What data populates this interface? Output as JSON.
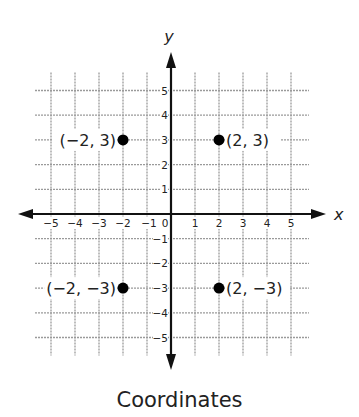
{
  "chart_data": {
    "type": "scatter",
    "title": "Coordinates",
    "xlabel": "x",
    "ylabel": "y",
    "xlim": [
      -5,
      5
    ],
    "ylim": [
      -5,
      5
    ],
    "grid": true,
    "x_ticks": [
      "-5",
      "-4",
      "-3",
      "-2",
      "-1",
      "0",
      "1",
      "2",
      "3",
      "4",
      "5"
    ],
    "y_ticks": [
      "5",
      "4",
      "3",
      "2",
      "1",
      "-1",
      "-2",
      "-3",
      "-4",
      "-5"
    ],
    "points": [
      {
        "x": -2,
        "y": 3,
        "label": "(−2, 3)"
      },
      {
        "x": 2,
        "y": 3,
        "label": "(2, 3)"
      },
      {
        "x": -2,
        "y": -3,
        "label": "(−2, −3)"
      },
      {
        "x": 2,
        "y": -3,
        "label": "(2, −3)"
      }
    ]
  },
  "caption": "Coordinates",
  "colors": {
    "axis": "#111111",
    "grid": "#9a9a9a",
    "point": "#000000",
    "text": "#222222"
  }
}
